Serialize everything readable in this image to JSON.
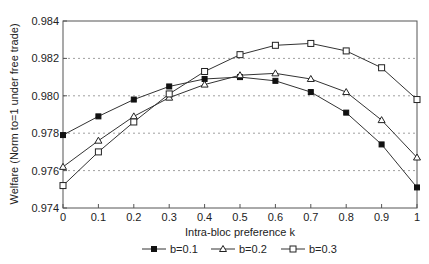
{
  "chart_data": {
    "type": "line",
    "title": "",
    "xlabel": "Intra-bloc preference k",
    "ylabel": "Welfare (Norm to=1 under free trade)",
    "x": [
      0,
      0.1,
      0.2,
      0.3,
      0.4,
      0.5,
      0.6,
      0.7,
      0.8,
      0.9,
      1
    ],
    "xticks": [
      "0",
      "0.1",
      "0.2",
      "0.3",
      "0.4",
      "0.5",
      "0.6",
      "0.7",
      "0.8",
      "0.9",
      "1"
    ],
    "yticks": [
      "0.974",
      "0.976",
      "0.978",
      "0.980",
      "0.982",
      "0.984"
    ],
    "xlim": [
      0,
      1
    ],
    "ylim": [
      0.974,
      0.984
    ],
    "grid": {
      "y": true,
      "x": false,
      "style": "dotted"
    },
    "legend_position": "bottom",
    "series": [
      {
        "name": "b=0.1",
        "marker": "filled-square",
        "values": [
          0.9779,
          0.9789,
          0.9798,
          0.9805,
          0.9809,
          0.981,
          0.9808,
          0.9802,
          0.9791,
          0.9774,
          0.9751
        ]
      },
      {
        "name": "b=0.2",
        "marker": "open-triangle",
        "values": [
          0.9762,
          0.9776,
          0.9789,
          0.9799,
          0.9806,
          0.9811,
          0.9812,
          0.9809,
          0.9802,
          0.9787,
          0.9767
        ]
      },
      {
        "name": "b=0.3",
        "marker": "open-square",
        "values": [
          0.9752,
          0.977,
          0.9786,
          0.9801,
          0.9813,
          0.9822,
          0.9827,
          0.9828,
          0.9824,
          0.9815,
          0.9798
        ]
      }
    ]
  }
}
